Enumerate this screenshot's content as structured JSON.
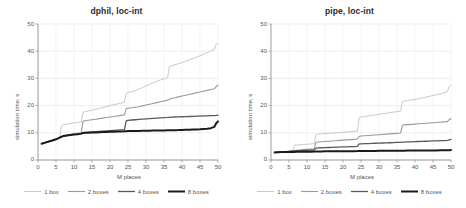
{
  "figure": {
    "width": 466,
    "height": 208,
    "background": "#ffffff"
  },
  "series_style": [
    {
      "name": "1 box",
      "color": "#c9c9c9",
      "width": 1.0
    },
    {
      "name": "2 boxes",
      "color": "#9a9a9a",
      "width": 1.1
    },
    {
      "name": "4 boxes",
      "color": "#5a5a5a",
      "width": 1.3
    },
    {
      "name": "8 boxes",
      "color": "#1a1a1a",
      "width": 2.0
    }
  ],
  "panels": [
    {
      "id": "dphil",
      "title": "dphil, loc-int",
      "legend": [
        "1 box",
        "2 boxes",
        "4 boxes",
        "8 boxes"
      ],
      "chart_data": {
        "type": "line",
        "title": "dphil, loc-int",
        "xlabel": "M places",
        "ylabel": "simulation time, s",
        "xlim": [
          0,
          50
        ],
        "ylim": [
          0,
          50
        ],
        "xticks": [
          0,
          5,
          10,
          15,
          20,
          25,
          30,
          35,
          40,
          45,
          50
        ],
        "yticks": [
          0,
          10,
          20,
          30,
          40,
          50
        ],
        "grid": true,
        "legend_position": "bottom",
        "x": [
          1,
          2,
          3,
          4,
          5,
          6,
          6.5,
          7,
          8,
          9,
          10,
          11,
          12,
          12.5,
          13,
          14,
          15,
          16,
          17,
          18,
          19,
          20,
          21,
          22,
          23,
          24,
          24.5,
          25,
          26,
          27,
          28,
          29,
          30,
          31,
          32,
          33,
          34,
          35,
          36,
          36.5,
          37,
          38,
          39,
          40,
          41,
          42,
          43,
          44,
          45,
          46,
          47,
          48,
          49,
          49.5,
          50
        ],
        "series": [
          {
            "name": "1 box",
            "values": [
              6.0,
              6.4,
              6.8,
              7.2,
              7.6,
              8.2,
              12.5,
              13.0,
              13.2,
              13.4,
              13.6,
              13.8,
              14.0,
              17.5,
              17.8,
              18.0,
              18.3,
              18.6,
              19.0,
              19.3,
              19.6,
              20.0,
              20.3,
              20.6,
              20.9,
              21.2,
              24.5,
              24.8,
              25.1,
              25.5,
              26.0,
              26.6,
              27.2,
              27.8,
              28.4,
              28.9,
              29.4,
              29.9,
              30.3,
              34.3,
              34.6,
              35.0,
              35.4,
              35.8,
              36.3,
              36.8,
              37.3,
              37.8,
              38.3,
              38.9,
              39.5,
              40.1,
              40.8,
              42.5,
              43.0
            ]
          },
          {
            "name": "2 boxes",
            "values": [
              6.0,
              6.4,
              6.8,
              7.2,
              7.6,
              8.2,
              8.6,
              8.9,
              9.2,
              9.4,
              9.6,
              9.8,
              10.0,
              14.2,
              14.4,
              14.6,
              14.8,
              15.0,
              15.2,
              15.4,
              15.6,
              15.8,
              16.0,
              16.2,
              16.4,
              16.6,
              18.8,
              19.0,
              19.2,
              19.4,
              19.6,
              19.9,
              20.2,
              20.5,
              20.8,
              21.1,
              21.4,
              21.7,
              22.0,
              22.3,
              22.6,
              22.9,
              23.2,
              23.5,
              23.8,
              24.1,
              24.4,
              24.7,
              25.0,
              25.3,
              25.6,
              25.9,
              26.2,
              27.0,
              27.5
            ]
          },
          {
            "name": "4 boxes",
            "values": [
              6.0,
              6.4,
              6.8,
              7.2,
              7.6,
              8.2,
              8.5,
              8.8,
              9.0,
              9.2,
              9.4,
              9.5,
              9.7,
              10.0,
              10.1,
              10.2,
              10.3,
              10.4,
              10.5,
              10.6,
              10.7,
              10.8,
              10.9,
              11.0,
              11.1,
              11.2,
              14.4,
              14.6,
              14.7,
              14.8,
              14.9,
              15.0,
              15.1,
              15.2,
              15.3,
              15.4,
              15.5,
              15.6,
              15.65,
              15.7,
              15.75,
              15.8,
              15.85,
              15.9,
              15.95,
              16.0,
              16.05,
              16.1,
              16.15,
              16.2,
              16.25,
              16.3,
              16.35,
              16.4,
              16.5
            ]
          },
          {
            "name": "8 boxes",
            "values": [
              6.0,
              6.4,
              6.8,
              7.2,
              7.6,
              8.2,
              8.5,
              8.8,
              9.0,
              9.2,
              9.4,
              9.5,
              9.7,
              9.9,
              10.0,
              10.05,
              10.1,
              10.15,
              10.2,
              10.25,
              10.3,
              10.35,
              10.4,
              10.45,
              10.5,
              10.55,
              10.6,
              10.62,
              10.65,
              10.68,
              10.7,
              10.72,
              10.75,
              10.78,
              10.8,
              10.82,
              10.85,
              10.88,
              10.9,
              10.92,
              10.95,
              10.98,
              11.0,
              11.05,
              11.1,
              11.15,
              11.2,
              11.25,
              11.3,
              11.4,
              11.5,
              11.7,
              12.2,
              13.5,
              14.2
            ]
          }
        ]
      }
    },
    {
      "id": "pipe",
      "title": "pipe, loc-int",
      "legend": [
        "1 box",
        "2 boxes",
        "4 boxes",
        "8 boxes"
      ],
      "chart_data": {
        "type": "line",
        "title": "pipe, loc-int",
        "xlabel": "M places",
        "ylabel": "simulation time, s",
        "xlim": [
          0,
          50
        ],
        "ylim": [
          0,
          50
        ],
        "xticks": [
          0,
          5,
          10,
          15,
          20,
          25,
          30,
          35,
          40,
          45,
          50
        ],
        "yticks": [
          0,
          10,
          20,
          30,
          40,
          50
        ],
        "grid": true,
        "legend_position": "bottom",
        "x": [
          1,
          2,
          3,
          4,
          5,
          6,
          6.5,
          7,
          8,
          9,
          10,
          11,
          12,
          12.5,
          13,
          14,
          15,
          16,
          17,
          18,
          19,
          20,
          21,
          22,
          23,
          24,
          24.5,
          25,
          26,
          27,
          28,
          29,
          30,
          31,
          32,
          33,
          34,
          35,
          36,
          36.5,
          37,
          38,
          39,
          40,
          41,
          42,
          43,
          44,
          45,
          46,
          47,
          48,
          49,
          49.5,
          50
        ],
        "series": [
          {
            "name": "1 box",
            "values": [
              2.8,
              2.9,
              3.0,
              3.1,
              3.2,
              3.4,
              5.4,
              5.5,
              5.6,
              5.7,
              5.8,
              5.9,
              6.0,
              9.4,
              9.5,
              9.6,
              9.7,
              9.8,
              9.9,
              10.0,
              10.1,
              10.2,
              10.3,
              10.4,
              10.5,
              10.6,
              15.6,
              15.8,
              16.0,
              16.2,
              16.4,
              16.6,
              16.8,
              17.0,
              17.2,
              17.4,
              17.6,
              17.8,
              18.0,
              21.5,
              21.7,
              21.9,
              22.1,
              22.3,
              22.5,
              22.8,
              23.1,
              23.4,
              23.7,
              24.0,
              24.3,
              24.7,
              25.2,
              27.0,
              27.5
            ]
          },
          {
            "name": "2 boxes",
            "values": [
              2.8,
              2.9,
              3.0,
              3.1,
              3.2,
              3.4,
              3.5,
              3.6,
              3.7,
              3.8,
              3.9,
              4.0,
              4.1,
              6.5,
              6.6,
              6.7,
              6.8,
              6.9,
              7.0,
              7.1,
              7.2,
              7.3,
              7.4,
              7.5,
              7.6,
              7.7,
              8.7,
              8.8,
              8.9,
              9.0,
              9.1,
              9.2,
              9.3,
              9.4,
              9.5,
              9.6,
              9.7,
              9.8,
              9.9,
              12.8,
              12.9,
              13.0,
              13.1,
              13.2,
              13.3,
              13.4,
              13.5,
              13.6,
              13.7,
              13.8,
              13.9,
              14.0,
              14.1,
              14.8,
              15.2
            ]
          },
          {
            "name": "4 boxes",
            "values": [
              2.8,
              2.9,
              3.0,
              3.1,
              3.2,
              3.3,
              3.35,
              3.4,
              3.45,
              3.5,
              3.55,
              3.6,
              3.65,
              4.4,
              4.45,
              4.5,
              4.55,
              4.6,
              4.65,
              4.7,
              4.75,
              4.8,
              4.85,
              4.9,
              4.95,
              5.0,
              5.9,
              5.95,
              6.0,
              6.05,
              6.1,
              6.15,
              6.2,
              6.25,
              6.3,
              6.35,
              6.4,
              6.45,
              6.5,
              6.55,
              6.6,
              6.65,
              6.7,
              6.75,
              6.8,
              6.85,
              6.9,
              6.95,
              7.0,
              7.05,
              7.1,
              7.15,
              7.2,
              7.4,
              7.6
            ]
          },
          {
            "name": "8 boxes",
            "values": [
              2.8,
              2.85,
              2.9,
              2.92,
              2.95,
              2.97,
              2.98,
              3.0,
              3.02,
              3.04,
              3.05,
              3.06,
              3.08,
              3.15,
              3.16,
              3.17,
              3.18,
              3.19,
              3.2,
              3.21,
              3.22,
              3.23,
              3.24,
              3.25,
              3.26,
              3.27,
              3.3,
              3.31,
              3.32,
              3.33,
              3.34,
              3.35,
              3.36,
              3.37,
              3.38,
              3.39,
              3.4,
              3.41,
              3.42,
              3.43,
              3.44,
              3.45,
              3.46,
              3.47,
              3.48,
              3.49,
              3.5,
              3.51,
              3.52,
              3.53,
              3.54,
              3.55,
              3.56,
              3.6,
              3.7
            ]
          }
        ]
      }
    }
  ]
}
